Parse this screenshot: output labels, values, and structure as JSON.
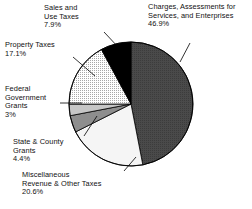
{
  "chart_data": {
    "type": "pie",
    "title": "",
    "subtitle": "",
    "legend_position": "callout-labels",
    "grid": false,
    "start_angle_deg": 0,
    "direction": "clockwise",
    "categories": [
      "Charges, Assessments for Services, and Enterprises",
      "Miscellaneous Revenue & Other Taxes",
      "State & County Grants",
      "Federal Government Grants",
      "Property Taxes",
      "Sales and Use Taxes"
    ],
    "values": [
      46.9,
      20.6,
      4.4,
      3,
      17.1,
      7.9
    ],
    "value_labels": [
      "46.9%",
      "20.6%",
      "4.4%",
      "3%",
      "17.1%",
      "7.9%"
    ],
    "unit": "%",
    "colors": [
      "#4a4a4a",
      "#f5f5f5",
      "#8e8e8e",
      "#c6c6c6",
      "#e2e2e2",
      "#000000"
    ],
    "slices": [
      {
        "name": "charges",
        "label_lines": [
          "Charges, Assessments for",
          "Services, and Enterprises"
        ],
        "percent_label": "46.9%",
        "value": 46.9,
        "color": "#4a4a4a",
        "fill_style": "dark-solid"
      },
      {
        "name": "miscellaneous",
        "label_lines": [
          "Miscellaneous",
          "Revenue & Other Taxes"
        ],
        "percent_label": "20.6%",
        "value": 20.6,
        "color": "#f5f5f5",
        "fill_style": "near-white"
      },
      {
        "name": "state-county-grants",
        "label_lines": [
          "State & County",
          "Grants"
        ],
        "percent_label": "4.4%",
        "value": 4.4,
        "color": "#8e8e8e",
        "fill_style": "medium-gray"
      },
      {
        "name": "federal-government-grants",
        "label_lines": [
          "Federal",
          "Government",
          "Grants"
        ],
        "percent_label": "3%",
        "value": 3,
        "color": "#c6c6c6",
        "fill_style": "light-gray"
      },
      {
        "name": "property-taxes",
        "label_lines": [
          "Property Taxes"
        ],
        "percent_label": "17.1%",
        "value": 17.1,
        "color": "#e2e2e2",
        "fill_style": "light-stipple"
      },
      {
        "name": "sales-use-taxes",
        "label_lines": [
          "Sales and",
          "Use Taxes"
        ],
        "percent_label": "7.9%",
        "value": 7.9,
        "color": "#000000",
        "fill_style": "black"
      }
    ],
    "xlabel": "",
    "ylabel": ""
  },
  "labels": {
    "charges": {
      "line1": "Charges, Assessments for",
      "line2": "Services, and Enterprises",
      "pct": "46.9%"
    },
    "sales": {
      "line1": "Sales and",
      "line2": "Use Taxes",
      "pct": "7.9%"
    },
    "property": {
      "line1": "Property Taxes",
      "pct": "17.1%"
    },
    "federal": {
      "line1": "Federal",
      "line2": "Government",
      "line3": "Grants",
      "pct": "3%"
    },
    "state": {
      "line1": "State & County",
      "line2": "Grants",
      "pct": "4.4%"
    },
    "misc": {
      "line1": "Miscellaneous",
      "line2": "Revenue & Other Taxes",
      "pct": "20.6%"
    }
  }
}
